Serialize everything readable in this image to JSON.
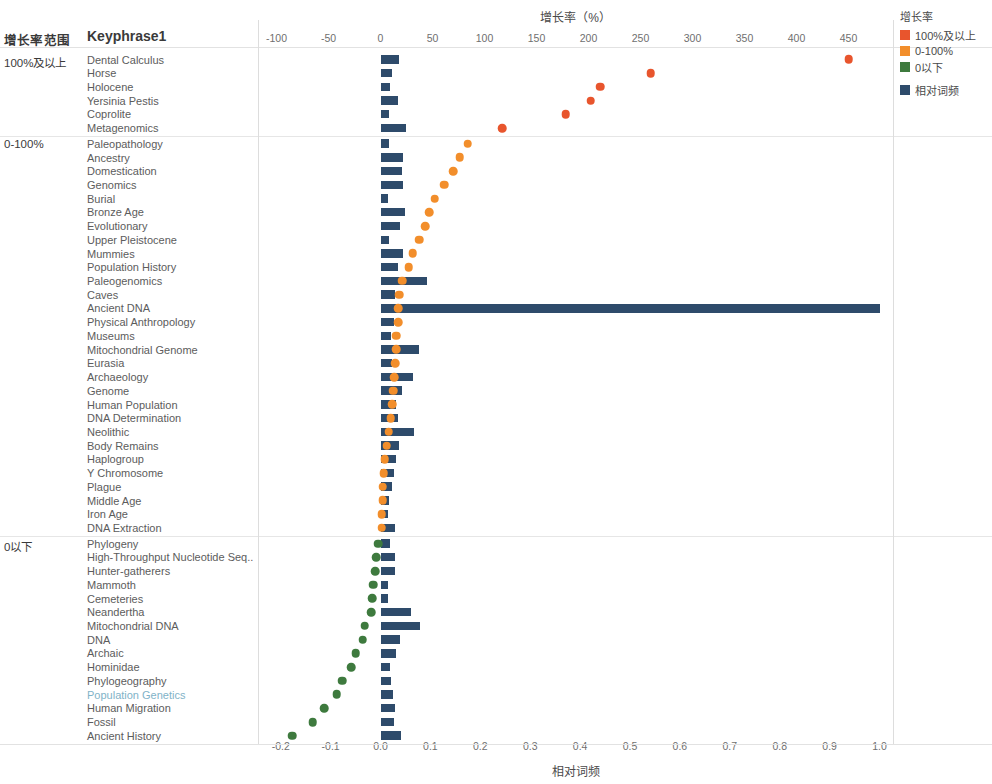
{
  "chart_data": {
    "type": "bar",
    "title": "",
    "orientation": "horizontal",
    "grid": false,
    "top_axis": {
      "label": "增长率（%）",
      "ticks": [
        -100,
        -50,
        0,
        50,
        100,
        150,
        200,
        250,
        300,
        350,
        400,
        450
      ],
      "range": [
        -100,
        470
      ],
      "series_name": "增长率"
    },
    "bottom_axis": {
      "label": "相对词频",
      "ticks": [
        "-0.2",
        "-0.1",
        "0.0",
        "0.1",
        "0.2",
        "0.3",
        "0.4",
        "0.5",
        "0.6",
        "0.7",
        "0.8",
        "0.9",
        "1.0"
      ],
      "range": [
        -0.24,
        1.06
      ],
      "series_name": "相对词频"
    },
    "column_headers": {
      "group": "增长率范围",
      "keyphrase": "Keyphrase1"
    },
    "legend": {
      "title": "增长率",
      "entries": [
        {
          "label": "100%及以上",
          "color": "#e8552d"
        },
        {
          "label": "0-100%",
          "color": "#f28e2b"
        },
        {
          "label": "0以下",
          "color": "#3e7a3e"
        },
        {
          "label": "相对词频",
          "color": "#2e4b6b"
        }
      ]
    },
    "groups": [
      {
        "name": "100%及以上",
        "dot_color": "#e8552d",
        "rows": [
          {
            "keyphrase": "Dental Calculus",
            "freq": 0.037,
            "growth": 450
          },
          {
            "keyphrase": "Horse",
            "freq": 0.023,
            "growth": 260
          },
          {
            "keyphrase": "Holocene",
            "freq": 0.02,
            "growth": 211
          },
          {
            "keyphrase": "Yersinia Pestis",
            "freq": 0.036,
            "growth": 202
          },
          {
            "keyphrase": "Coprolite",
            "freq": 0.018,
            "growth": 178
          },
          {
            "keyphrase": "Metagenomics",
            "freq": 0.052,
            "growth": 117
          }
        ]
      },
      {
        "name": "0-100%",
        "dot_color": "#f28e2b",
        "rows": [
          {
            "keyphrase": "Paleopathology",
            "freq": 0.018,
            "growth": 84
          },
          {
            "keyphrase": "Ancestry",
            "freq": 0.045,
            "growth": 76
          },
          {
            "keyphrase": "Domestication",
            "freq": 0.044,
            "growth": 70
          },
          {
            "keyphrase": "Genomics",
            "freq": 0.046,
            "growth": 61
          },
          {
            "keyphrase": "Burial",
            "freq": 0.015,
            "growth": 52
          },
          {
            "keyphrase": "Bronze Age",
            "freq": 0.05,
            "growth": 47
          },
          {
            "keyphrase": "Evolutionary",
            "freq": 0.04,
            "growth": 43
          },
          {
            "keyphrase": "Upper Pleistocene",
            "freq": 0.017,
            "growth": 37
          },
          {
            "keyphrase": "Mummies",
            "freq": 0.045,
            "growth": 31
          },
          {
            "keyphrase": "Population History",
            "freq": 0.035,
            "growth": 27
          },
          {
            "keyphrase": "Paleogenomics",
            "freq": 0.094,
            "growth": 21
          },
          {
            "keyphrase": "Caves",
            "freq": 0.03,
            "growth": 18
          },
          {
            "keyphrase": "Ancient DNA",
            "freq": 1.0,
            "growth": 17
          },
          {
            "keyphrase": "Physical Anthropology",
            "freq": 0.027,
            "growth": 17
          },
          {
            "keyphrase": "Museums",
            "freq": 0.022,
            "growth": 15
          },
          {
            "keyphrase": "Mitochondrial Genome",
            "freq": 0.078,
            "growth": 15
          },
          {
            "keyphrase": "Eurasia",
            "freq": 0.023,
            "growth": 14
          },
          {
            "keyphrase": "Archaeology",
            "freq": 0.066,
            "growth": 13
          },
          {
            "keyphrase": "Genome",
            "freq": 0.043,
            "growth": 12
          },
          {
            "keyphrase": "Human Population",
            "freq": 0.031,
            "growth": 11
          },
          {
            "keyphrase": "DNA Determination",
            "freq": 0.035,
            "growth": 10
          },
          {
            "keyphrase": "Neolithic",
            "freq": 0.068,
            "growth": 8
          },
          {
            "keyphrase": "Body Remains",
            "freq": 0.038,
            "growth": 6
          },
          {
            "keyphrase": "Haplogroup",
            "freq": 0.031,
            "growth": 4
          },
          {
            "keyphrase": "Y Chromosome",
            "freq": 0.027,
            "growth": 3
          },
          {
            "keyphrase": "Plague",
            "freq": 0.024,
            "growth": 2
          },
          {
            "keyphrase": "Middle Age",
            "freq": 0.018,
            "growth": 2
          },
          {
            "keyphrase": "Iron Age",
            "freq": 0.015,
            "growth": 1
          },
          {
            "keyphrase": "DNA Extraction",
            "freq": 0.029,
            "growth": 1
          }
        ]
      },
      {
        "name": "0以下",
        "dot_color": "#3e7a3e",
        "rows": [
          {
            "keyphrase": "Phylogeny",
            "freq": 0.019,
            "growth": -2
          },
          {
            "keyphrase": "High-Throughput Nucleotide Seq..",
            "freq": 0.029,
            "growth": -4
          },
          {
            "keyphrase": "Hunter-gatherers",
            "freq": 0.029,
            "growth": -5
          },
          {
            "keyphrase": "Mammoth",
            "freq": 0.016,
            "growth": -7
          },
          {
            "keyphrase": "Cemeteries",
            "freq": 0.016,
            "growth": -8
          },
          {
            "keyphrase": "Neandertha",
            "freq": 0.062,
            "growth": -9
          },
          {
            "keyphrase": "Mitochondrial DNA",
            "freq": 0.08,
            "growth": -15
          },
          {
            "keyphrase": "DNA",
            "freq": 0.04,
            "growth": -17
          },
          {
            "keyphrase": "Archaic",
            "freq": 0.032,
            "growth": -24
          },
          {
            "keyphrase": "Hominidae",
            "freq": 0.02,
            "growth": -28
          },
          {
            "keyphrase": "Phylogeography",
            "freq": 0.021,
            "growth": -37
          },
          {
            "keyphrase": "Population Genetics",
            "freq": 0.026,
            "growth": -42,
            "selected": true
          },
          {
            "keyphrase": "Human Migration",
            "freq": 0.029,
            "growth": -54
          },
          {
            "keyphrase": "Fossil",
            "freq": 0.027,
            "growth": -65
          },
          {
            "keyphrase": "Ancient History",
            "freq": 0.042,
            "growth": -85
          }
        ]
      }
    ]
  }
}
